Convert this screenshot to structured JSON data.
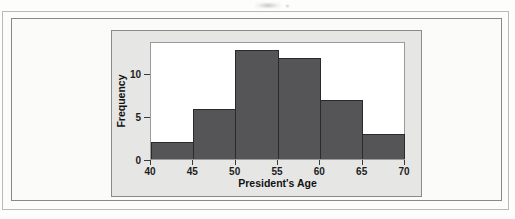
{
  "figure": {
    "panel_background": "#e6e6e4",
    "plot_background": "#ffffff",
    "bar_color": "#555557",
    "bar_outline": "#2a2a2c"
  },
  "chart_data": {
    "type": "bar",
    "title": "",
    "subtitle": "",
    "xlabel": "President's Age",
    "ylabel": "Frequency",
    "categories": [
      "40-45",
      "45-50",
      "50-55",
      "55-60",
      "60-65",
      "65-70"
    ],
    "bin_edges": [
      40,
      45,
      50,
      55,
      60,
      65,
      70
    ],
    "values": [
      2,
      6,
      13,
      12,
      7,
      3
    ],
    "xlim": [
      40,
      70
    ],
    "ylim": [
      0,
      13.8
    ],
    "xticks": [
      40,
      45,
      50,
      55,
      60,
      65,
      70
    ],
    "xticklabels": [
      "40",
      "45",
      "50",
      "55",
      "60",
      "65",
      "70"
    ],
    "yticks": [
      0,
      5,
      10
    ],
    "yticklabels": [
      "0",
      "5",
      "10"
    ],
    "grid": false,
    "legend": null
  }
}
